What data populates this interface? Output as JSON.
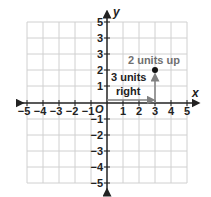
{
  "diagram": {
    "x_axis_label": "x",
    "y_axis_label": "y",
    "origin_label": "O",
    "x_ticks": [
      "−5",
      "−4",
      "−3",
      "−2",
      "−1",
      "1",
      "2",
      "3",
      "4",
      "5"
    ],
    "y_ticks_pos": [
      "5",
      "3",
      "3",
      "2",
      "1"
    ],
    "y_ticks_neg": [
      "−1",
      "−2",
      "−3",
      "−4",
      "−5"
    ],
    "point": {
      "x": 3,
      "y": 2
    },
    "annotations": {
      "up": "2 units up",
      "right_line1": "3 units",
      "right_line2": "right"
    },
    "colors": {
      "grid": "#d0d0d0",
      "axis": "#222222",
      "arrow": "#808080",
      "annotation_up": "#707070"
    }
  }
}
